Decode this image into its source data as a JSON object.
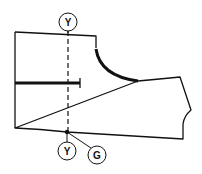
{
  "diagram": {
    "type": "sewing-pattern-piece",
    "labels": {
      "top_marker": "Y",
      "bottom_marker_left": "Y",
      "bottom_marker_right": "G"
    },
    "colors": {
      "stroke": "#111111",
      "background": "#ffffff"
    }
  }
}
